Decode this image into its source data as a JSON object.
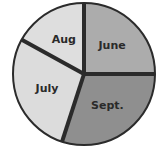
{
  "chart_data": {
    "type": "pie",
    "title": "",
    "categories": [
      "June",
      "Sept.",
      "July",
      "Aug"
    ],
    "values": [
      25,
      30,
      28,
      17
    ],
    "units": "percent (estimated from slice angles)",
    "start_angle_deg": 90,
    "direction": "clockwise",
    "colors": [
      "#acacac",
      "#8f8f8f",
      "#dcdcdc",
      "#dedede"
    ],
    "legend": "none (labels inside slices)"
  },
  "style": {
    "stroke": "#2b2b2b",
    "background": "#ffffff"
  }
}
